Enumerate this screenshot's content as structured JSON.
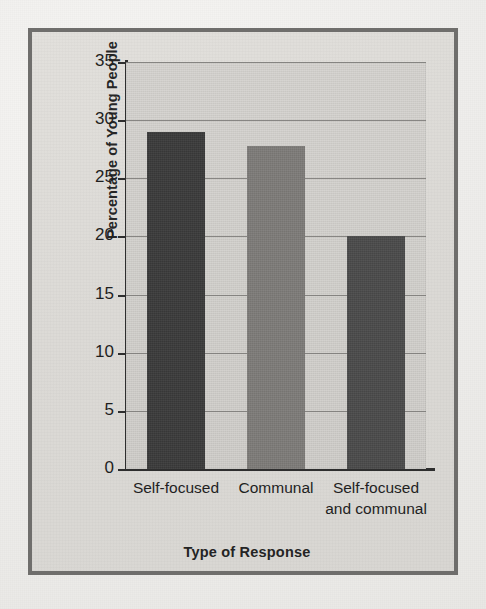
{
  "figure": {
    "frame_border_color": "#6f6e6c",
    "panel_background": "#dcdad6",
    "plot_background": "#cccac6"
  },
  "axes": {
    "ylabel": "Percentage of Young People",
    "xlabel": "Type of Response",
    "ytick_labels": [
      "0",
      "5",
      "10",
      "15",
      "20",
      "25",
      "30",
      "35"
    ],
    "xtick_labels": [
      "Self-focused",
      "Communal",
      "Self-focused\nand communal"
    ]
  },
  "chart_data": {
    "type": "bar",
    "title": "",
    "subtitle": "",
    "xlabel": "Type of Response",
    "ylabel": "Percentage of Young People",
    "categories": [
      "Self-focused",
      "Communal",
      "Self-focused and communal"
    ],
    "values": [
      29,
      27.8,
      20
    ],
    "bar_colors": [
      "#3a3a3a",
      "#7d7b78",
      "#4a4a4a"
    ],
    "ylim": [
      0,
      35
    ],
    "ytick_values": [
      0,
      5,
      10,
      15,
      20,
      25,
      30,
      35
    ],
    "grid": true,
    "grid_axis": "y",
    "legend": false,
    "legend_position": "none",
    "annotations": []
  }
}
